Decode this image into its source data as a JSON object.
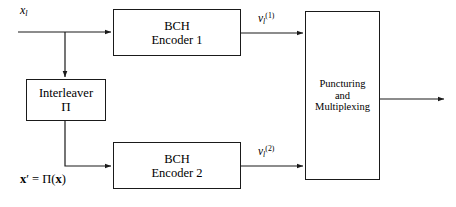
{
  "figure": {
    "type": "block-diagram",
    "background_color": "#ffffff",
    "line_color": "#1a1a1a"
  },
  "blocks": {
    "encoder1": {
      "line1": "BCH",
      "line2": "Encoder 1"
    },
    "encoder2": {
      "line1": "BCH",
      "line2": "Encoder 2"
    },
    "interleaver": {
      "line1": "Interleaver",
      "line2": "Π"
    },
    "puncturing": {
      "line1": "Puncturing",
      "line2": "and",
      "line3": "Multiplexing"
    }
  },
  "labels": {
    "input": {
      "base": "x",
      "sub": "l"
    },
    "v1": {
      "base": "v",
      "sub": "l",
      "sup": "(1)"
    },
    "v2": {
      "base": "v",
      "sub": "l",
      "sup": "(2)"
    },
    "x_prime_eq": {
      "lhs": "x",
      "prime": "′",
      "eq": "=",
      "pi": "Π",
      "open": "(",
      "arg": "x",
      "close": ")"
    }
  },
  "wires": {
    "input_line_y": 32,
    "branch_x": 65,
    "encoder1_out_y": 33,
    "encoder2_out_y": 166,
    "output_y": 99,
    "output_end_x": 446
  }
}
